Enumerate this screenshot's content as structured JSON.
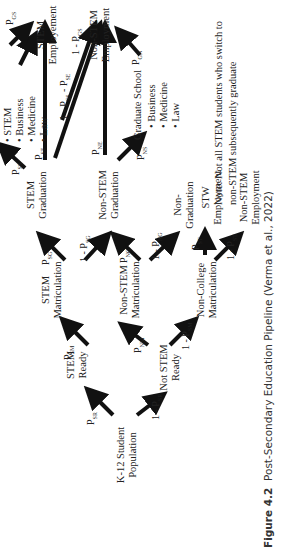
{
  "figure": {
    "number": "Figure 4.2",
    "caption": "Post-Secondary Education Pipeline (Verma et al., 2022)"
  },
  "nodes": {
    "k12": [
      "K-12 Student",
      "Population"
    ],
    "stem_ready": [
      "STEM",
      "Ready"
    ],
    "not_stem_ready": [
      "Not STEM",
      "Ready"
    ],
    "stem_matriculation": [
      "STEM",
      "Matriculation"
    ],
    "non_stem_matriculation": [
      "Non-STEM",
      "Matriculation"
    ],
    "non_college_matriculation": [
      "Non-College",
      "Matriculation"
    ],
    "stem_graduation": [
      "STEM",
      "Graduation"
    ],
    "non_stem_graduation": [
      "Non-STEM",
      "Graduation"
    ],
    "non_graduation": [
      "Non-",
      "Graduation"
    ],
    "stw_employment": [
      "STW",
      "Employment"
    ],
    "non_stem_employment_bottom": [
      "Non-STEM",
      "Employment"
    ],
    "stem_employment": [
      "STEM",
      "Employement"
    ],
    "non_stem_employment_top": [
      "Non-STEM",
      "Employment"
    ],
    "graduate_school": "Graduate School"
  },
  "lists": {
    "stem_grad_options": [
      "STEM",
      "Business",
      "Medicine",
      "Law"
    ],
    "graduate_school_options": [
      "Business",
      "Medicine",
      "Law"
    ]
  },
  "probabilities": {
    "p_sr": [
      "P",
      "SR"
    ],
    "one_minus_p_sr": [
      "1 - P",
      "SR"
    ],
    "p_sm": [
      "P",
      "SM"
    ],
    "p_nm": [
      "P",
      "NM"
    ],
    "one_minus_p_sm": [
      "1 - P",
      "SM"
    ],
    "p_sg": [
      "P",
      "SG"
    ],
    "one_minus_p_sg": [
      "1 - P",
      "SG"
    ],
    "p_ng": [
      "P",
      "NG"
    ],
    "one_minus_p_ng": [
      "1 - P",
      "NG"
    ],
    "p_st": [
      "P",
      "ST"
    ],
    "one_minus_p_st": [
      "1 - P",
      "ST"
    ],
    "p_ss": [
      "P",
      "SS"
    ],
    "p_se": [
      "P",
      "SE"
    ],
    "one_minus_p_ss_p_se": [
      "1 - P",
      "SS",
      " - P",
      "SE"
    ],
    "p_ne": [
      "P",
      "NE"
    ],
    "p_ns": [
      "P",
      "NS"
    ],
    "p_gs": [
      "P",
      "GS"
    ],
    "one_minus_p_gs": [
      "1 - P",
      "GS"
    ],
    "p_gn": [
      "P",
      "GN"
    ]
  },
  "note": "Note: Not all STEM students who switch to non-STEM subsequently graduate",
  "colors": {
    "arrow": "#111111",
    "text": "#222222",
    "background": "#ffffff"
  }
}
